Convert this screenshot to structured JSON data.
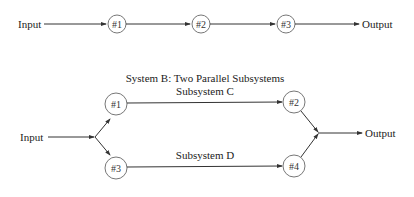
{
  "system_a": {
    "input_label": "Input",
    "output_label": "Output",
    "nodes": [
      "#1",
      "#2",
      "#3"
    ]
  },
  "system_b": {
    "title": "System B: Two Parallel Subsystems",
    "subsystem_c_label": "Subsystem C",
    "subsystem_d_label": "Subsystem D",
    "input_label": "Input",
    "output_label": "Output",
    "nodes": [
      "#1",
      "#2",
      "#3",
      "#4"
    ]
  }
}
